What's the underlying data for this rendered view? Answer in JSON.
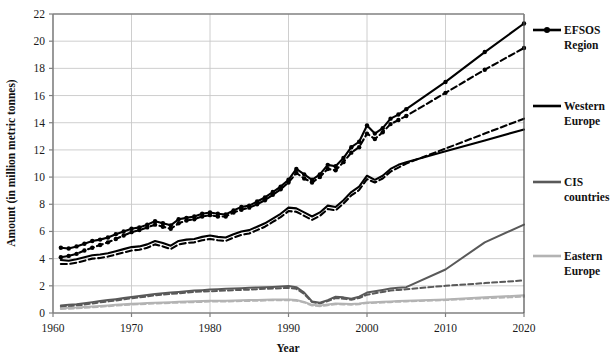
{
  "chart_data": {
    "type": "line",
    "title": "",
    "xlabel": "Year",
    "ylabel": "Amount (in million metric tonnes)",
    "xlim": [
      1960,
      2020
    ],
    "ylim": [
      0,
      22
    ],
    "xticks": [
      1960,
      1970,
      1980,
      1990,
      2000,
      2010,
      2020
    ],
    "yticks": [
      0,
      2,
      4,
      6,
      8,
      10,
      12,
      14,
      16,
      18,
      20,
      22
    ],
    "grid": true,
    "legend_position": "right",
    "colors": {
      "efsos_region": "#000000",
      "western_europe": "#000000",
      "cis_countries": "#595959",
      "eastern_europe": "#b3b3b3",
      "grid": "#c8c8c8",
      "axis": "#808080"
    },
    "legend": [
      {
        "label": "EFSOS Region",
        "key": "efsos_region",
        "style": "line-with-markers",
        "color": "#000000"
      },
      {
        "label": "Western Europe",
        "key": "western_europe",
        "style": "solid",
        "color": "#000000"
      },
      {
        "label": "CIS countries",
        "key": "cis_countries",
        "style": "solid",
        "color": "#595959"
      },
      {
        "label": "Eastern Europe",
        "key": "eastern_europe",
        "style": "solid",
        "color": "#b3b3b3"
      }
    ],
    "x": [
      1961,
      1962,
      1963,
      1964,
      1965,
      1966,
      1967,
      1968,
      1969,
      1970,
      1971,
      1972,
      1973,
      1974,
      1975,
      1976,
      1977,
      1978,
      1979,
      1980,
      1981,
      1982,
      1983,
      1984,
      1985,
      1986,
      1987,
      1988,
      1989,
      1990,
      1991,
      1992,
      1993,
      1994,
      1995,
      1996,
      1997,
      1998,
      1999,
      2000,
      2001,
      2002,
      2003,
      2004,
      2005,
      2010,
      2015,
      2020
    ],
    "series": [
      {
        "name": "EFSOS Region",
        "key": "efsos_region",
        "style": "solid",
        "color": "#000000",
        "markers": true,
        "values": [
          4.8,
          4.75,
          4.9,
          5.1,
          5.3,
          5.4,
          5.55,
          5.8,
          6.0,
          6.2,
          6.3,
          6.5,
          6.75,
          6.6,
          6.45,
          6.9,
          7.0,
          7.1,
          7.3,
          7.4,
          7.3,
          7.25,
          7.55,
          7.8,
          7.9,
          8.2,
          8.5,
          8.9,
          9.3,
          9.8,
          10.6,
          10.2,
          9.8,
          10.2,
          10.9,
          10.8,
          11.4,
          12.2,
          12.6,
          13.8,
          13.2,
          13.6,
          14.3,
          14.6,
          15.0,
          17.0,
          19.2,
          21.3
        ]
      },
      {
        "name": "EFSOS Region (projection)",
        "key": "efsos_region_dashed",
        "style": "dashed",
        "color": "#000000",
        "markers": true,
        "values": [
          4.1,
          4.2,
          4.35,
          4.6,
          4.8,
          5.0,
          5.2,
          5.45,
          5.7,
          5.95,
          6.1,
          6.3,
          6.5,
          6.35,
          6.2,
          6.6,
          6.8,
          6.9,
          7.1,
          7.2,
          7.1,
          7.1,
          7.4,
          7.6,
          7.75,
          8.0,
          8.3,
          8.7,
          9.1,
          9.6,
          10.3,
          9.9,
          9.6,
          10.0,
          10.6,
          10.5,
          11.1,
          11.8,
          12.2,
          13.2,
          12.8,
          13.3,
          13.9,
          14.2,
          14.5,
          16.2,
          17.9,
          19.5
        ]
      },
      {
        "name": "Western Europe",
        "key": "western_europe",
        "style": "solid",
        "color": "#000000",
        "markers": false,
        "values": [
          3.9,
          3.85,
          3.95,
          4.1,
          4.25,
          4.3,
          4.4,
          4.55,
          4.7,
          4.85,
          4.9,
          5.05,
          5.3,
          5.15,
          4.95,
          5.3,
          5.4,
          5.45,
          5.6,
          5.7,
          5.6,
          5.55,
          5.8,
          6.0,
          6.1,
          6.35,
          6.6,
          6.95,
          7.3,
          7.75,
          7.7,
          7.4,
          7.1,
          7.4,
          7.9,
          7.8,
          8.3,
          8.9,
          9.3,
          10.1,
          9.8,
          10.1,
          10.6,
          10.9,
          11.1,
          11.9,
          12.7,
          13.5
        ]
      },
      {
        "name": "Western Europe (projection)",
        "key": "western_europe_dashed",
        "style": "dashed",
        "color": "#000000",
        "markers": false,
        "values": [
          3.6,
          3.6,
          3.7,
          3.85,
          4.0,
          4.05,
          4.15,
          4.3,
          4.45,
          4.6,
          4.65,
          4.8,
          5.05,
          4.9,
          4.7,
          5.05,
          5.15,
          5.2,
          5.35,
          5.45,
          5.35,
          5.3,
          5.55,
          5.75,
          5.85,
          6.1,
          6.35,
          6.7,
          7.05,
          7.5,
          7.45,
          7.15,
          6.85,
          7.15,
          7.65,
          7.55,
          8.05,
          8.65,
          9.05,
          9.85,
          9.6,
          9.9,
          10.4,
          10.7,
          11.0,
          12.1,
          13.2,
          14.3
        ]
      },
      {
        "name": "CIS countries",
        "key": "cis_countries",
        "style": "solid",
        "color": "#595959",
        "markers": false,
        "values": [
          0.55,
          0.6,
          0.65,
          0.72,
          0.8,
          0.88,
          0.95,
          1.02,
          1.1,
          1.18,
          1.25,
          1.32,
          1.4,
          1.45,
          1.5,
          1.55,
          1.6,
          1.65,
          1.68,
          1.72,
          1.75,
          1.78,
          1.8,
          1.82,
          1.85,
          1.88,
          1.9,
          1.92,
          1.95,
          1.98,
          1.9,
          1.5,
          0.85,
          0.75,
          0.95,
          1.2,
          1.15,
          1.05,
          1.2,
          1.5,
          1.6,
          1.7,
          1.8,
          1.85,
          1.9,
          3.2,
          5.2,
          6.5
        ]
      },
      {
        "name": "CIS countries (projection)",
        "key": "cis_countries_dashed",
        "style": "dashed",
        "color": "#595959",
        "markers": false,
        "values": [
          0.45,
          0.5,
          0.55,
          0.62,
          0.7,
          0.78,
          0.85,
          0.92,
          1.0,
          1.08,
          1.15,
          1.22,
          1.3,
          1.35,
          1.4,
          1.45,
          1.5,
          1.55,
          1.58,
          1.6,
          1.62,
          1.65,
          1.68,
          1.7,
          1.72,
          1.75,
          1.78,
          1.8,
          1.82,
          1.85,
          1.78,
          1.4,
          0.8,
          0.7,
          0.88,
          1.1,
          1.05,
          0.98,
          1.1,
          1.35,
          1.45,
          1.55,
          1.65,
          1.7,
          1.75,
          2.0,
          2.2,
          2.4
        ]
      },
      {
        "name": "Eastern Europe",
        "key": "eastern_europe",
        "style": "solid",
        "color": "#b3b3b3",
        "markers": false,
        "values": [
          0.35,
          0.38,
          0.4,
          0.44,
          0.48,
          0.52,
          0.56,
          0.6,
          0.64,
          0.68,
          0.7,
          0.73,
          0.76,
          0.78,
          0.8,
          0.82,
          0.84,
          0.86,
          0.88,
          0.9,
          0.9,
          0.9,
          0.92,
          0.94,
          0.95,
          0.96,
          0.98,
          1.0,
          1.0,
          1.0,
          0.95,
          0.82,
          0.6,
          0.55,
          0.62,
          0.7,
          0.68,
          0.66,
          0.7,
          0.78,
          0.8,
          0.82,
          0.85,
          0.88,
          0.9,
          1.0,
          1.15,
          1.3
        ]
      },
      {
        "name": "Eastern Europe (projection)",
        "key": "eastern_europe_dashed",
        "style": "dashed",
        "color": "#b3b3b3",
        "markers": false,
        "values": [
          0.3,
          0.32,
          0.34,
          0.38,
          0.42,
          0.46,
          0.5,
          0.54,
          0.58,
          0.62,
          0.64,
          0.67,
          0.7,
          0.72,
          0.74,
          0.76,
          0.78,
          0.8,
          0.82,
          0.84,
          0.84,
          0.84,
          0.86,
          0.88,
          0.89,
          0.9,
          0.92,
          0.94,
          0.94,
          0.94,
          0.9,
          0.78,
          0.55,
          0.5,
          0.57,
          0.65,
          0.63,
          0.61,
          0.65,
          0.73,
          0.75,
          0.77,
          0.8,
          0.83,
          0.85,
          0.95,
          1.08,
          1.2
        ]
      }
    ]
  }
}
